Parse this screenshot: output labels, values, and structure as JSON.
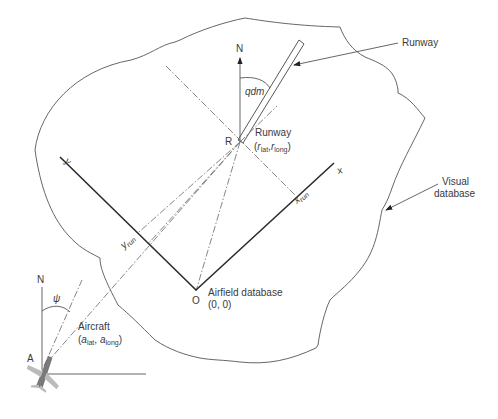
{
  "diagram": {
    "labels": {
      "runway_callout": "Runway",
      "visual_database_line1": "Visual",
      "visual_database_line2": "database",
      "north_runway": "N",
      "north_aircraft": "N",
      "qdm": "qdm",
      "R": "R",
      "runway_point_title": "Runway",
      "runway_point_coords": {
        "open": "(",
        "r1": "r",
        "r1_sub": "lat",
        "sep": ",",
        "r2": "r",
        "r2_sub": "long",
        "close": ")"
      },
      "x_axis": "x",
      "y_axis": "y",
      "x_run": "x",
      "x_run_sub": "run",
      "y_run": "y",
      "y_run_sub": "run",
      "origin": "O",
      "origin_title": "Airfield database",
      "origin_coords": "(0, 0)",
      "psi": "ψ",
      "A": "A",
      "aircraft_title": "Aircraft",
      "aircraft_coords": {
        "open": "(",
        "a1": "a",
        "a1_sub": "lat",
        "sep": ", ",
        "a2": "a",
        "a2_sub": "long",
        "close": ")"
      }
    },
    "colors": {
      "line": "#2b2b2b",
      "outline": "#555555",
      "dashdot": "#777777",
      "aircraft": "#8a8a8a"
    }
  }
}
